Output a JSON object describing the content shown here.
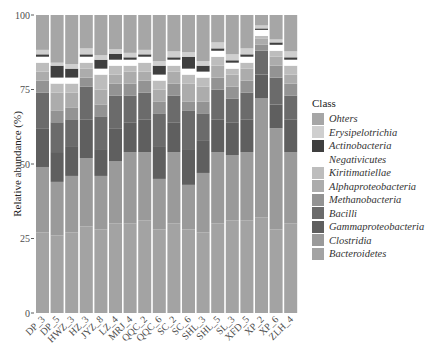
{
  "chart_data": {
    "type": "bar",
    "stacked": true,
    "title": "",
    "xlabel": "",
    "ylabel": "Relative abundance (%)",
    "ylim": [
      0,
      100
    ],
    "yticks": [
      0,
      25,
      50,
      75,
      100
    ],
    "grid": false,
    "legend_position": "right",
    "legend_title": "Class",
    "categories": [
      "DP_3",
      "DP_5",
      "HWZ_3",
      "HZ_3",
      "JYZ_8",
      "LZ_4",
      "MRJ_4",
      "QQC_2",
      "QQC_6",
      "SC_2",
      "SC_6",
      "SHL_3",
      "SHL_5",
      "SL_3",
      "XFD_5",
      "XP_2",
      "XP_6",
      "ZLH_4"
    ],
    "series": [
      {
        "name": "Bacteroidetes",
        "color": "#a3a3a3",
        "values": [
          27,
          26,
          27,
          29,
          28,
          30,
          30,
          31,
          28,
          30,
          28,
          27,
          30,
          31,
          31,
          32,
          28,
          30
        ]
      },
      {
        "name": "Clostridia",
        "color": "#9a9a9a",
        "values": [
          22,
          18,
          19,
          23,
          18,
          21,
          24,
          23,
          17,
          24,
          15,
          20,
          24,
          22,
          23,
          40,
          34,
          24
        ]
      },
      {
        "name": "Gammaproteobacteria",
        "color": "#5f5f5f",
        "values": [
          13,
          10,
          10,
          13,
          9,
          11,
          10,
          11,
          11,
          10,
          12,
          11,
          11,
          11,
          11,
          8,
          8,
          11
        ]
      },
      {
        "name": "Bacilli",
        "color": "#6b6b6b",
        "values": [
          12,
          10,
          9,
          11,
          11,
          11,
          9,
          9,
          11,
          9,
          13,
          9,
          10,
          8,
          9,
          8,
          9,
          8
        ]
      },
      {
        "name": "Methanobacteria",
        "color": "#939393",
        "values": [
          4,
          4,
          4,
          3,
          4,
          4,
          4,
          4,
          4,
          4,
          3,
          4,
          4,
          4,
          4,
          2,
          4,
          4
        ]
      },
      {
        "name": "Alphaproteobacteria",
        "color": "#acacac",
        "values": [
          3,
          6,
          5,
          3,
          5,
          3,
          4,
          3,
          4,
          4,
          6,
          5,
          4,
          4,
          4,
          2,
          3,
          3
        ]
      },
      {
        "name": "Kiritimatiellae",
        "color": "#bdbdbd",
        "values": [
          3,
          3,
          3,
          2,
          5,
          3,
          2,
          3,
          3,
          2,
          3,
          3,
          3,
          2,
          2,
          1,
          2,
          3
        ]
      },
      {
        "name": "Negativicutes",
        "color": "#ffffff",
        "values": [
          2,
          2,
          2,
          2,
          2,
          2,
          2,
          2,
          2,
          2,
          2,
          2,
          2,
          2,
          2,
          2,
          2,
          2
        ]
      },
      {
        "name": "Actinobacteria",
        "color": "#3f3f3f",
        "values": [
          0.8,
          4,
          3,
          0.8,
          3,
          2,
          0.8,
          0.8,
          3,
          0.8,
          4,
          2,
          0.8,
          0.8,
          0.8,
          0.5,
          0.8,
          0.8
        ]
      },
      {
        "name": "Erysipelotrichia",
        "color": "#cfcfcf",
        "values": [
          1.5,
          1,
          1.5,
          2,
          1.5,
          1.5,
          1.5,
          1.5,
          1.5,
          2,
          1.5,
          1.5,
          2,
          2,
          2,
          1,
          1,
          2
        ]
      },
      {
        "name": "Ohters",
        "color": "#a6a6a6",
        "values": [
          11.7,
          16,
          16.5,
          11.2,
          13.5,
          11.5,
          12.7,
          11.7,
          15.5,
          12.2,
          12.5,
          15.5,
          9.2,
          13.2,
          11.2,
          3.5,
          8.2,
          12.2
        ]
      }
    ]
  },
  "axis": {
    "ylabel": "Relative abundance (%)",
    "yticks": [
      "0",
      "25",
      "50",
      "75",
      "100"
    ]
  },
  "legend": {
    "title": "Class",
    "items": [
      {
        "label": "Ohters",
        "color": "#a6a6a6"
      },
      {
        "label": "Erysipelotrichia",
        "color": "#cfcfcf"
      },
      {
        "label": "Actinobacteria",
        "color": "#3f3f3f"
      },
      {
        "label": "Negativicutes",
        "color": "#ffffff"
      },
      {
        "label": "Kiritimatiellae",
        "color": "#bdbdbd"
      },
      {
        "label": "Alphaproteobacteria",
        "color": "#acacac"
      },
      {
        "label": "Methanobacteria",
        "color": "#939393"
      },
      {
        "label": "Bacilli",
        "color": "#6b6b6b"
      },
      {
        "label": "Gammaproteobacteria",
        "color": "#5f5f5f"
      },
      {
        "label": "Clostridia",
        "color": "#9a9a9a"
      },
      {
        "label": "Bacteroidetes",
        "color": "#a3a3a3"
      }
    ]
  }
}
